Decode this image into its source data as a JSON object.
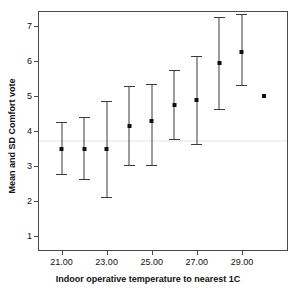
{
  "chart": {
    "title": "",
    "x_title": "Indoor operative temperature to nearest 1C",
    "y_title": "Mean and SD Comfort vote"
  },
  "axes": {
    "y_ticks": [
      "1",
      "2",
      "3",
      "4",
      "5",
      "6",
      "7"
    ],
    "x_ticks": [
      "21.00",
      "23.00",
      "25.00",
      "27.00",
      "29.00"
    ]
  },
  "chart_data": {
    "type": "scatter",
    "title": "",
    "xlabel": "Indoor operative temperature to nearest 1C",
    "ylabel": "Mean and SD Comfort vote",
    "xlim": [
      20.0,
      31.0
    ],
    "ylim": [
      0.6,
      7.4
    ],
    "grid": false,
    "legend": null,
    "error_type": "SD",
    "x": [
      21,
      22,
      23,
      24,
      25,
      26,
      27,
      28,
      29,
      30
    ],
    "x_tick_values": [
      21,
      23,
      25,
      27,
      29
    ],
    "y_tick_values": [
      1,
      2,
      3,
      4,
      5,
      6,
      7
    ],
    "values": [
      3.5,
      3.5,
      3.5,
      4.15,
      4.3,
      4.75,
      4.9,
      5.95,
      6.25,
      5.0
    ],
    "lower": [
      2.75,
      2.6,
      2.1,
      3.0,
      3.0,
      3.75,
      3.6,
      4.6,
      5.3,
      5.0
    ],
    "upper": [
      4.25,
      4.4,
      4.85,
      5.3,
      5.35,
      5.75,
      6.15,
      7.25,
      7.35,
      5.0
    ],
    "series": [
      {
        "name": "Mean and SD Comfort vote",
        "points": [
          {
            "x": 21,
            "mean": 3.5,
            "low": 2.75,
            "high": 4.25
          },
          {
            "x": 22,
            "mean": 3.5,
            "low": 2.6,
            "high": 4.4
          },
          {
            "x": 23,
            "mean": 3.5,
            "low": 2.1,
            "high": 4.85
          },
          {
            "x": 24,
            "mean": 4.15,
            "low": 3.0,
            "high": 5.3
          },
          {
            "x": 25,
            "mean": 4.3,
            "low": 3.0,
            "high": 5.35
          },
          {
            "x": 26,
            "mean": 4.75,
            "low": 3.75,
            "high": 5.75
          },
          {
            "x": 27,
            "mean": 4.9,
            "low": 3.6,
            "high": 6.15
          },
          {
            "x": 28,
            "mean": 5.95,
            "low": 4.6,
            "high": 7.25
          },
          {
            "x": 29,
            "mean": 6.25,
            "low": 5.3,
            "high": 7.35
          },
          {
            "x": 30,
            "mean": 5.0,
            "low": 5.0,
            "high": 5.0
          }
        ]
      }
    ],
    "reference_line_y": 3.75
  },
  "colors": {
    "marker": "#111111",
    "bar": "#3a3a3a",
    "frame": "#4a4a4a",
    "reference_line": "#f2f1ef",
    "background": "#ffffff"
  }
}
